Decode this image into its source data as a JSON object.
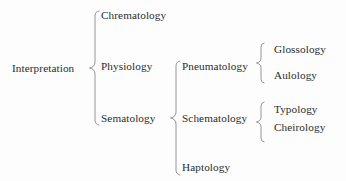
{
  "diagram": {
    "type": "tree",
    "colors": {
      "background": "#fdfdfd",
      "text": "#2b2b2b",
      "brace_stroke": "#8a8a8a"
    },
    "root": {
      "label": "Interpretation"
    },
    "level1": [
      {
        "label": "Chrematology"
      },
      {
        "label": "Physiology"
      },
      {
        "label": "Sematology"
      }
    ],
    "level2": [
      {
        "label": "Pneumatology"
      },
      {
        "label": "Schematology"
      },
      {
        "label": "Haptology"
      }
    ],
    "level3_pneumatology": [
      {
        "label": "Glossology"
      },
      {
        "label": "Aulology"
      }
    ],
    "level3_schematology": [
      {
        "label": "Typology"
      },
      {
        "label": "Cheirology"
      }
    ],
    "braces": {
      "root_brace": "curly-brace-icon",
      "sematology_brace": "curly-brace-icon",
      "pneumatology_brace": "curly-brace-icon",
      "schematology_brace": "curly-brace-icon"
    }
  }
}
